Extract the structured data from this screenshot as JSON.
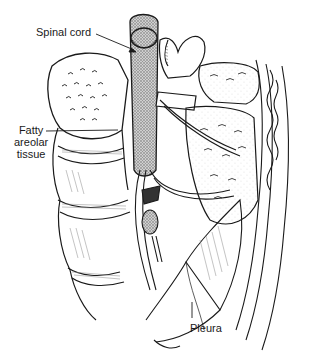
{
  "figure": {
    "labels": {
      "spinal_cord": "Spinal cord",
      "fatty_areolar_tissue": [
        "Fatty",
        "areolar",
        "tissue"
      ],
      "pleura": "Pleura"
    },
    "colors": {
      "ink": "#1a1a1a",
      "hatch_gray": "#9a9a9a",
      "background": "#ffffff"
    }
  }
}
